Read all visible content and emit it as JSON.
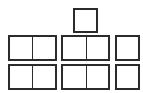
{
  "diagram": {
    "stroke_color": "#2b2b2b",
    "background": "#ffffff",
    "top_box": {
      "cells": 1
    },
    "rows": [
      {
        "groups": [
          {
            "cells": 2
          },
          {
            "cells": 2
          },
          {
            "cells": 1
          }
        ]
      },
      {
        "groups": [
          {
            "cells": 2
          },
          {
            "cells": 2
          },
          {
            "cells": 1
          }
        ]
      }
    ]
  }
}
